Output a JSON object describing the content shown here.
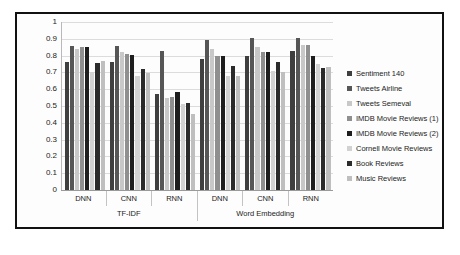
{
  "chart_data": {
    "type": "bar",
    "title": "",
    "xlabel": "",
    "ylabel": "",
    "ylim": [
      0,
      1
    ],
    "ytick_labels": [
      "1",
      "0.9",
      "0.8",
      "0.7",
      "0.6",
      "0.5",
      "0.4",
      "0.3",
      "0.2",
      "0.1",
      "0"
    ],
    "ytick_values": [
      1,
      0.9,
      0.8,
      0.7,
      0.6,
      0.5,
      0.4,
      0.3,
      0.2,
      0.1,
      0
    ],
    "grid": true,
    "legend_position": "right",
    "categories": [
      "DNN",
      "CNN",
      "RNN",
      "DNN",
      "CNN",
      "RNN"
    ],
    "major_groups": [
      {
        "label": "TF-IDF",
        "categories": [
          "DNN",
          "CNN",
          "RNN"
        ]
      },
      {
        "label": "Word Embedding",
        "categories": [
          "DNN",
          "CNN",
          "RNN"
        ]
      }
    ],
    "series": [
      {
        "name": "Sentiment 140",
        "color": "#3f3f3f",
        "values": [
          0.76,
          0.76,
          0.57,
          0.78,
          0.795,
          0.825
        ]
      },
      {
        "name": "Tweets Airline",
        "color": "#565656",
        "values": [
          0.86,
          0.855,
          0.83,
          0.895,
          0.905,
          0.905
        ]
      },
      {
        "name": "Tweets Semeval",
        "color": "#c8c8c8",
        "values": [
          0.84,
          0.82,
          0.545,
          0.84,
          0.85,
          0.865
        ]
      },
      {
        "name": "IMDB Movie Reviews (1)",
        "color": "#8f8f8f",
        "values": [
          0.85,
          0.81,
          0.555,
          0.8,
          0.82,
          0.865
        ]
      },
      {
        "name": "IMDB Movie Reviews (2)",
        "color": "#1e1e1e",
        "values": [
          0.85,
          0.805,
          0.585,
          0.8,
          0.82,
          0.8
        ]
      },
      {
        "name": "Cornell Movie Reviews",
        "color": "#d2d2d2",
        "values": [
          0.7,
          0.68,
          0.51,
          0.68,
          0.71,
          0.75
        ]
      },
      {
        "name": "Book Reviews",
        "color": "#2b2b2b",
        "values": [
          0.755,
          0.72,
          0.515,
          0.74,
          0.76,
          0.725
        ]
      },
      {
        "name": "Music Reviews",
        "color": "#bfbfbf",
        "values": [
          0.77,
          0.695,
          0.45,
          0.68,
          0.705,
          0.73
        ]
      }
    ]
  }
}
